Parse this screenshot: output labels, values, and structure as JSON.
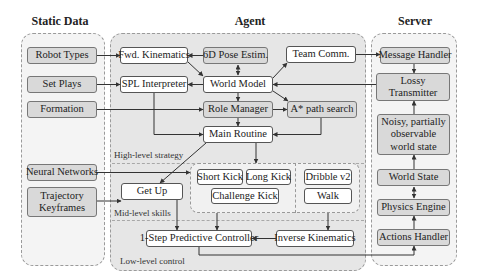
{
  "titles": {
    "static": "Static Data",
    "agent": "Agent",
    "server": "Server"
  },
  "static_data": {
    "items": [
      "Robot Types",
      "Set Plays",
      "Formation",
      "Neural Networks",
      "Trajectory Keyframes"
    ]
  },
  "agent": {
    "high_level": {
      "label": "High-level strategy",
      "fwd_kinematics": "Fwd. Kinematics",
      "pose_estim": "6D Pose Estim.",
      "team_comm": "Team Comm.",
      "spl_interpreter": "SPL Interpreter",
      "world_model": "World Model",
      "role_manager": "Role Manager",
      "a_star": "A* path search",
      "main_routine": "Main Routine"
    },
    "mid_level": {
      "label": "Mid-level skills",
      "get_up": "Get Up",
      "short_kick": "Short Kick",
      "long_kick": "Long Kick",
      "challenge_kick": "Challenge Kick",
      "dribble": "Dribble v2",
      "walk": "Walk"
    },
    "low_level": {
      "label": "Low-level control",
      "predictive_controller": "1-Step Predictive Controller",
      "inverse_kinematics": "Inverse Kinematics"
    }
  },
  "server": {
    "message_handler": "Message Handler",
    "lossy_transmitter": "Lossy Transmitter",
    "noisy_state": "Noisy, partially observable world state",
    "world_state": "World State",
    "physics_engine": "Physics Engine",
    "actions_handler": "Actions Handler"
  },
  "colors": {
    "agent_panel": "#e6e6e6",
    "side_panel": "#f4f4f4",
    "gray_box": "#d9d9d9",
    "white_box": "#ffffff",
    "arrow": "#333333"
  }
}
